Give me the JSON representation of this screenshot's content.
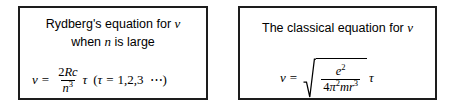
{
  "figure": {
    "type": "two-panel equation comparison",
    "background_color": "#ffffff",
    "border_color": "#1d1d1d",
    "text_color": "#000000"
  },
  "panels": [
    {
      "id": "rydberg",
      "caption_line1_prefix": "Rydberg's equation for ",
      "caption_line1_symbol": "ν",
      "caption_line2_prefix": "when ",
      "caption_line2_symbol": "n",
      "caption_line2_suffix": " is large",
      "equation": {
        "lhs": "ν",
        "relation": "=",
        "fraction_numerator_coefficient": "2",
        "fraction_numerator_symbols": "Rc",
        "fraction_denominator_base": "n",
        "fraction_denominator_exponent": "3",
        "multiplier": "τ",
        "condition_open": "(",
        "condition_symbol": "τ",
        "condition_relation": "=",
        "condition_values": "1,2,3",
        "condition_ellipsis": "⋯",
        "condition_close": ")"
      }
    },
    {
      "id": "classical",
      "caption_line1_prefix": "The classical equation for ",
      "caption_line1_symbol": "ν",
      "equation": {
        "lhs": "ν",
        "relation": "=",
        "radicand_numerator_base": "e",
        "radicand_numerator_exponent": "2",
        "radicand_denominator_coefficient": "4",
        "radicand_denominator_pi": "π",
        "radicand_denominator_pi_exponent": "2",
        "radicand_denominator_mass": "m",
        "radicand_denominator_radius_base": "r",
        "radicand_denominator_radius_exponent": "3",
        "multiplier": "τ"
      }
    }
  ]
}
